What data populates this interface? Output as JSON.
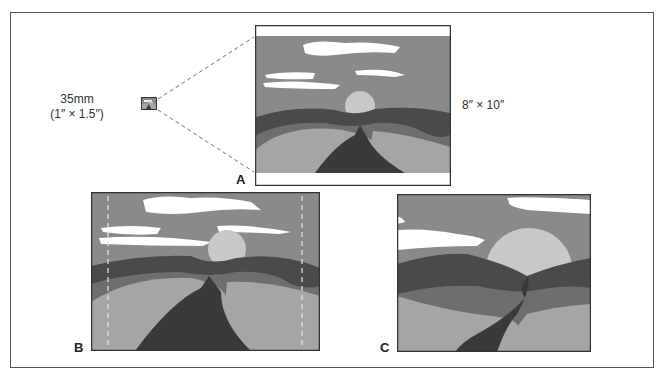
{
  "figure": {
    "film_label_line1": "35mm",
    "film_label_line2": "(1″ × 1.5″)",
    "print_label": "8″ × 10″",
    "panels": [
      {
        "id": "A",
        "letter": "A",
        "description": "35mm frame enlarged to 8x10 print with white bands top and bottom"
      },
      {
        "id": "B",
        "letter": "B",
        "description": "Full frame with dashed crop lines at left and right"
      },
      {
        "id": "C",
        "letter": "C",
        "description": "Tighter crop enlarging sun and hills"
      }
    ],
    "colors": {
      "sky": "#8a8a8a",
      "cloud": "#ffffff",
      "sun": "#c8c8c8",
      "far_hill": "#4a4a4a",
      "mid_hill": "#6e6e6e",
      "near_hill": "#a5a5a5",
      "river": "#3a3a3a",
      "border": "#333333",
      "dash": "#777777"
    }
  }
}
